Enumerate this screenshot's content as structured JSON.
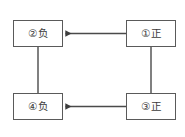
{
  "diagram": {
    "type": "node-link-diagram",
    "background_color": "#ffffff",
    "box_border_color": "#5a5a5a",
    "line_color": "#4a4a4a",
    "text_color": "#3c3c3c",
    "nodes": [
      {
        "id": "node-2",
        "label": "②负",
        "marker": "②",
        "charge": "负",
        "position": "top-left"
      },
      {
        "id": "node-1",
        "label": "①正",
        "marker": "①",
        "charge": "正",
        "position": "top-right"
      },
      {
        "id": "node-4",
        "label": "④负",
        "marker": "④",
        "charge": "负",
        "position": "bottom-left"
      },
      {
        "id": "node-3",
        "label": "③正",
        "marker": "③",
        "charge": "正",
        "position": "bottom-right"
      }
    ],
    "edges": [
      {
        "id": "edge-top",
        "from": "node-1",
        "to": "node-2",
        "arrow": "to",
        "orientation": "horizontal"
      },
      {
        "id": "edge-bottom",
        "from": "node-3",
        "to": "node-4",
        "arrow": "to",
        "orientation": "horizontal"
      },
      {
        "id": "edge-left",
        "from": "node-2",
        "to": "node-4",
        "arrow": "none",
        "orientation": "vertical"
      },
      {
        "id": "edge-right",
        "from": "node-1",
        "to": "node-3",
        "arrow": "none",
        "orientation": "vertical"
      }
    ]
  }
}
